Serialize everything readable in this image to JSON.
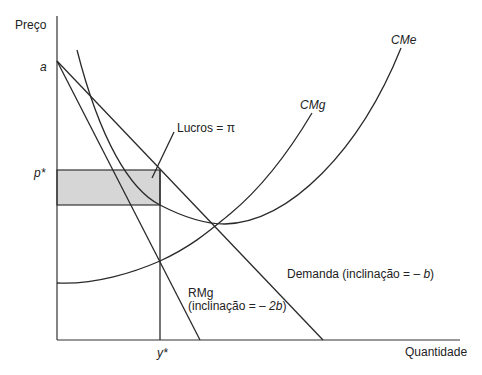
{
  "axes": {
    "y_label": "Preço",
    "x_label": "Quantidade",
    "y_ticks": {
      "a": "a",
      "p_star": "p*"
    },
    "x_ticks": {
      "y_star": "y*"
    }
  },
  "curves": {
    "cme": {
      "label": "CMe"
    },
    "cmg": {
      "label": "CMg"
    },
    "demand": {
      "label": "Demanda (inclinação = – ",
      "slope_var": "b",
      "close": ")"
    },
    "rmg": {
      "label": "RMg",
      "slope_prefix": "(inclinação = – ",
      "slope_var": "2b",
      "close": ")"
    }
  },
  "profit": {
    "label": "Lucros = π",
    "fill_color": "#d6d6d6"
  },
  "colors": {
    "line": "#2a2a2a",
    "text": "#222222",
    "background": "#ffffff"
  }
}
